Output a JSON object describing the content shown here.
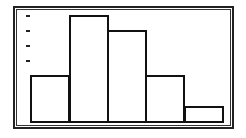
{
  "chart_data": {
    "type": "bar",
    "subtype": "histogram",
    "title": "",
    "xlabel": "",
    "ylabel": "",
    "categories": [
      "1",
      "2",
      "3",
      "4",
      "5"
    ],
    "values": [
      3,
      7,
      6,
      3,
      1
    ],
    "ylim": [
      0,
      7
    ],
    "y_tick_marks": [
      4,
      5,
      6,
      7
    ],
    "grid": false,
    "legend": null,
    "colors": {
      "bar_fill": "#ffffff",
      "bar_edge": "#111111",
      "frame": "#222222"
    }
  },
  "layout": {
    "baseline_y": 121,
    "unit_px": 15.2,
    "bar_x": [
      30,
      69,
      107,
      145,
      184
    ],
    "bar_width": 39
  }
}
